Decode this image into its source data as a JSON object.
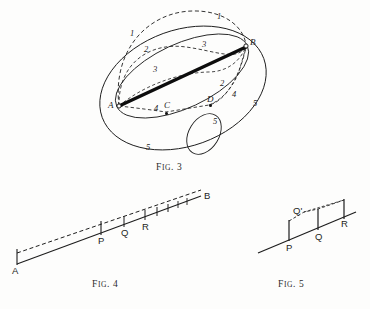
{
  "plate": {
    "name": "geometry-figure-plate",
    "background": "#fdfdfc",
    "ink": "#1d1d1d",
    "width": 370,
    "height": 309
  },
  "figures": [
    {
      "id": "fig3",
      "caption": "Fig. 3",
      "caption_small": "IG",
      "caption_lead": "F",
      "caption_tail": ". 3",
      "description": "Sphere-like oval with chord AB and several numbered arcs",
      "points": [
        {
          "label": "A",
          "x": 119,
          "y": 106
        },
        {
          "label": "B",
          "x": 246,
          "y": 46
        },
        {
          "label": "C",
          "x": 166,
          "y": 110
        },
        {
          "label": "D",
          "x": 209,
          "y": 104
        }
      ],
      "arc_labels": [
        {
          "label": "1",
          "x": 217,
          "y": 17
        },
        {
          "label": "1",
          "x": 131,
          "y": 33
        },
        {
          "label": "2",
          "x": 145,
          "y": 50
        },
        {
          "label": "3",
          "x": 203,
          "y": 45
        },
        {
          "label": "3",
          "x": 154,
          "y": 70
        },
        {
          "label": "2",
          "x": 221,
          "y": 84
        },
        {
          "label": "4",
          "x": 232,
          "y": 95
        },
        {
          "label": "4",
          "x": 155,
          "y": 110
        },
        {
          "label": "5",
          "x": 253,
          "y": 104
        },
        {
          "label": "5",
          "x": 214,
          "y": 122
        },
        {
          "label": "5",
          "x": 147,
          "y": 148
        }
      ]
    },
    {
      "id": "fig4",
      "caption": "Fig. 4",
      "caption_lead": "F",
      "caption_small": "IG",
      "caption_tail": ". 4",
      "description": "Nearly straight inclined line A to B with solid and dashed parallel paths and tick marks",
      "points": [
        {
          "label": "A",
          "x": 15,
          "y": 268
        },
        {
          "label": "B",
          "x": 205,
          "y": 197
        },
        {
          "label": "P",
          "x": 101,
          "y": 236
        },
        {
          "label": "Q",
          "x": 125,
          "y": 228
        },
        {
          "label": "R",
          "x": 146,
          "y": 224
        }
      ]
    },
    {
      "id": "fig5",
      "caption": "Fig. 5",
      "caption_lead": "F",
      "caption_small": "IG",
      "caption_tail": ". 5",
      "description": "Detail of inclined line with ordinates at P, Q, R and intermediate point Q prime",
      "points": [
        {
          "label": "P",
          "x": 289,
          "y": 248
        },
        {
          "label": "Q'",
          "x": 296,
          "y": 212
        },
        {
          "label": "Q",
          "x": 318,
          "y": 240
        },
        {
          "label": "R",
          "x": 342,
          "y": 228
        }
      ]
    }
  ]
}
